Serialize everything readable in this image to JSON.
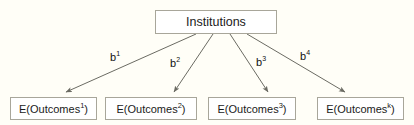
{
  "diagram": {
    "type": "node-link-path-diagram",
    "background_color": "#fffef7",
    "box_border_color": "#a8a69a",
    "box_fill_color": "#ffffff",
    "arrow_color": "#6b6b63",
    "root": {
      "label": "Institutions"
    },
    "leaves": [
      {
        "text": "E(Outcomes",
        "sup": "1",
        "tail": ")"
      },
      {
        "text": "E(Outcomes",
        "sup": "2",
        "tail": ")"
      },
      {
        "text": "E(Outcomes",
        "sup": "3",
        "tail": ")"
      },
      {
        "text": "E(Outcomes",
        "sup": "k",
        "tail": ")"
      }
    ],
    "edges": [
      {
        "label": "b",
        "sup": "1"
      },
      {
        "label": "b",
        "sup": "2"
      },
      {
        "label": "b",
        "sup": "3"
      },
      {
        "label": "b",
        "sup": "4"
      }
    ]
  }
}
